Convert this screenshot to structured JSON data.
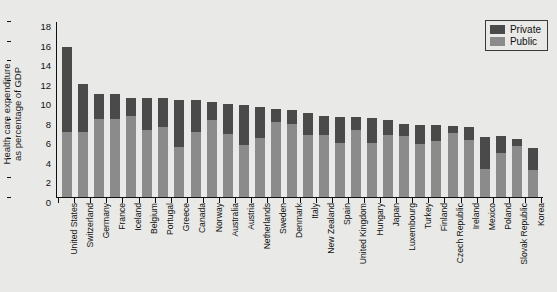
{
  "chart_data": {
    "type": "bar",
    "stacked": true,
    "title": "",
    "xlabel": "",
    "ylabel": "Health care expenditure\nas percentage of GDP",
    "ylim": [
      0,
      18
    ],
    "yticks": [
      0,
      2,
      4,
      6,
      8,
      10,
      12,
      14,
      16,
      18
    ],
    "grid": false,
    "legend_position": "top-right",
    "categories": [
      "United States",
      "Switzerland",
      "Germany",
      "France",
      "Iceland",
      "Belgium",
      "Portugal",
      "Greece",
      "Canada",
      "Norway",
      "Australia",
      "Austria",
      "Netherlands",
      "Sweden",
      "Denmark",
      "Italy",
      "New Zealand",
      "Spain",
      "United Kingdom",
      "Hungary",
      "Japan",
      "Luxembourg",
      "Turkey",
      "Finland",
      "Czech Republic",
      "Ireland",
      "Mexico",
      "Poland",
      "Slovak Republic",
      "Korea"
    ],
    "series": [
      {
        "name": "Public",
        "color": "#8b8b8b",
        "values": [
          6.7,
          6.6,
          8.0,
          8.0,
          8.3,
          6.9,
          7.2,
          5.1,
          6.7,
          7.9,
          6.4,
          5.3,
          6.0,
          7.7,
          7.5,
          6.3,
          6.3,
          5.5,
          6.9,
          5.5,
          6.3,
          6.2,
          5.4,
          5.7,
          6.5,
          5.8,
          2.9,
          4.5,
          5.2,
          2.8
        ]
      },
      {
        "name": "Private",
        "color": "#4a4a4a",
        "values": [
          8.6,
          5.0,
          2.5,
          2.5,
          1.8,
          3.2,
          2.9,
          4.8,
          3.2,
          1.8,
          3.1,
          4.1,
          3.2,
          1.3,
          1.4,
          2.3,
          2.0,
          2.7,
          1.3,
          2.6,
          1.6,
          1.3,
          2.0,
          1.7,
          0.8,
          1.4,
          3.2,
          1.7,
          0.7,
          2.2
        ]
      }
    ],
    "totals": [
      15.3,
      11.6,
      10.5,
      10.5,
      10.1,
      10.1,
      10.1,
      9.9,
      9.9,
      9.7,
      9.5,
      9.4,
      9.2,
      9.0,
      8.9,
      8.6,
      8.3,
      8.2,
      8.2,
      8.1,
      7.9,
      7.5,
      7.4,
      7.4,
      7.3,
      7.2,
      6.1,
      6.2,
      5.9,
      5.0
    ]
  },
  "legend": {
    "items": [
      {
        "label": "Private",
        "color": "#4a4a4a"
      },
      {
        "label": "Public",
        "color": "#8b8b8b"
      }
    ]
  },
  "axis": {
    "y_title": "Health care expenditure\nas percentage of GDP"
  }
}
